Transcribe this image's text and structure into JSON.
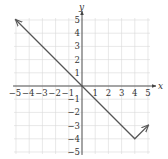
{
  "chart_data": {
    "type": "line",
    "title": "",
    "xlabel": "x",
    "ylabel": "y",
    "xlim": [
      -5,
      5
    ],
    "ylim": [
      -5,
      5
    ],
    "grid": true,
    "x_ticks": [
      -5,
      -4,
      -3,
      -2,
      -1,
      1,
      2,
      3,
      4,
      5
    ],
    "y_ticks": [
      5,
      4,
      3,
      2,
      1,
      -1,
      -2,
      -3,
      -4,
      -5
    ],
    "x_tick_labels": [
      "−5",
      "−4",
      "−3",
      "−2",
      "−1",
      "1",
      "2",
      "3",
      "4",
      "5"
    ],
    "y_tick_labels": [
      "5",
      "4",
      "3",
      "2",
      "1",
      "−1",
      "−2",
      "−3",
      "−4",
      "−5"
    ],
    "series": [
      {
        "name": "f(x)",
        "points": [
          [
            -5,
            5
          ],
          [
            0,
            0
          ],
          [
            4,
            -4
          ],
          [
            5,
            -3
          ]
        ],
        "arrows": [
          "start",
          "end"
        ]
      }
    ],
    "legend": null
  },
  "colors": {
    "grid": "#d9d9d9",
    "axis": "#444444",
    "line": "#555555",
    "text": "#333333"
  }
}
